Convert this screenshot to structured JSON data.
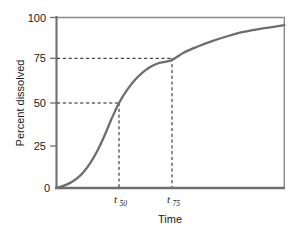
{
  "chart_data": {
    "type": "line",
    "title": "",
    "xlabel": "Time",
    "ylabel": "Percent dissolved",
    "grid": false,
    "legend": false,
    "xlim": [
      0,
      10
    ],
    "ylim": [
      0,
      100
    ],
    "y_ticks": [
      0,
      25,
      50,
      75,
      100
    ],
    "y_tick_labels": [
      "0",
      "25",
      "50",
      "75",
      "100"
    ],
    "x_ticks": [
      2.75,
      5.05
    ],
    "x_tick_labels": [
      "t50",
      "t75"
    ],
    "series": [
      {
        "name": "Dissolution profile",
        "color": "#6d6d6d",
        "x": [
          0.0,
          0.3,
          0.6,
          0.9,
          1.2,
          1.5,
          1.8,
          2.1,
          2.4,
          2.75,
          3.1,
          3.45,
          3.8,
          4.15,
          4.5,
          5.05,
          5.6,
          6.2,
          6.8,
          7.5,
          8.2,
          9.0,
          10.0
        ],
        "y": [
          0.0,
          1.2,
          3.0,
          5.6,
          9.5,
          15.0,
          22.0,
          30.5,
          40.0,
          50.0,
          57.5,
          63.5,
          68.0,
          71.2,
          73.3,
          75.0,
          79.5,
          83.0,
          86.0,
          89.0,
          91.5,
          93.5,
          95.5
        ]
      }
    ],
    "annotations": [
      {
        "id": "t50-guide",
        "kind": "guide-lines",
        "style": "dashed",
        "y_value": 50,
        "x_value": 2.75,
        "x_label": "t50"
      },
      {
        "id": "t75-guide",
        "kind": "guide-lines",
        "style": "dashed",
        "y_value": 75,
        "x_value": 5.05,
        "x_label": "t75"
      }
    ]
  },
  "axes": {
    "y_title": "Percent dissolved",
    "x_title": "Time",
    "y_tick_0": "0",
    "y_tick_25": "25",
    "y_tick_50": "50",
    "y_tick_75": "75",
    "y_tick_100": "100"
  },
  "markers": {
    "t50": {
      "base": "t",
      "sub": "50"
    },
    "t75": {
      "base": "t",
      "sub": "75"
    }
  },
  "colors": {
    "curve": "#6d6d6d",
    "axis": "#707070",
    "frame": "#8a8a8a",
    "guide": "#1a1a1a",
    "text": "#1a1a1a",
    "background": "#ffffff"
  }
}
